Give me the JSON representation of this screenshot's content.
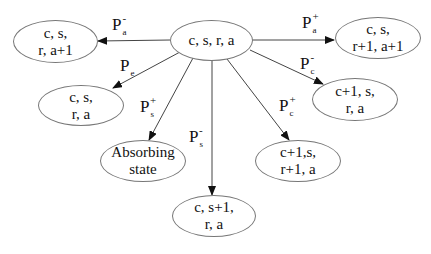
{
  "diagram": {
    "type": "state-transition",
    "center": {
      "line1": "c, s, r, a",
      "line2": ""
    },
    "nodes": {
      "left_top": {
        "line1": "c, s,",
        "line2": "r, a+1"
      },
      "right_top": {
        "line1": "c, s,",
        "line2": "r+1, a+1"
      },
      "left_mid": {
        "line1": "c, s,",
        "line2": "r, a"
      },
      "right_mid": {
        "line1": "c+1, s,",
        "line2": "r, a"
      },
      "absorbing": {
        "line1": "Absorbing",
        "line2": "state"
      },
      "right_low": {
        "line1": "c+1,s,",
        "line2": "r+1, a"
      },
      "bottom": {
        "line1": "c, s+1,",
        "line2": "r, a"
      }
    },
    "edges": {
      "to_left_top": {
        "base": "P",
        "sub": "a",
        "sup": "-"
      },
      "to_right_top": {
        "base": "P",
        "sub": "a",
        "sup": "+"
      },
      "to_left_mid": {
        "base": "P",
        "sub": "e",
        "sup": ""
      },
      "to_right_mid": {
        "base": "P",
        "sub": "c",
        "sup": "-"
      },
      "to_absorbing": {
        "base": "P",
        "sub": "s",
        "sup": "+"
      },
      "to_right_low": {
        "base": "P",
        "sub": "c",
        "sup": "+"
      },
      "to_bottom": {
        "base": "P",
        "sub": "s",
        "sup": "-"
      }
    },
    "colors": {
      "line": "#444444",
      "ellipse_border": "#777777",
      "text": "#111111"
    }
  }
}
